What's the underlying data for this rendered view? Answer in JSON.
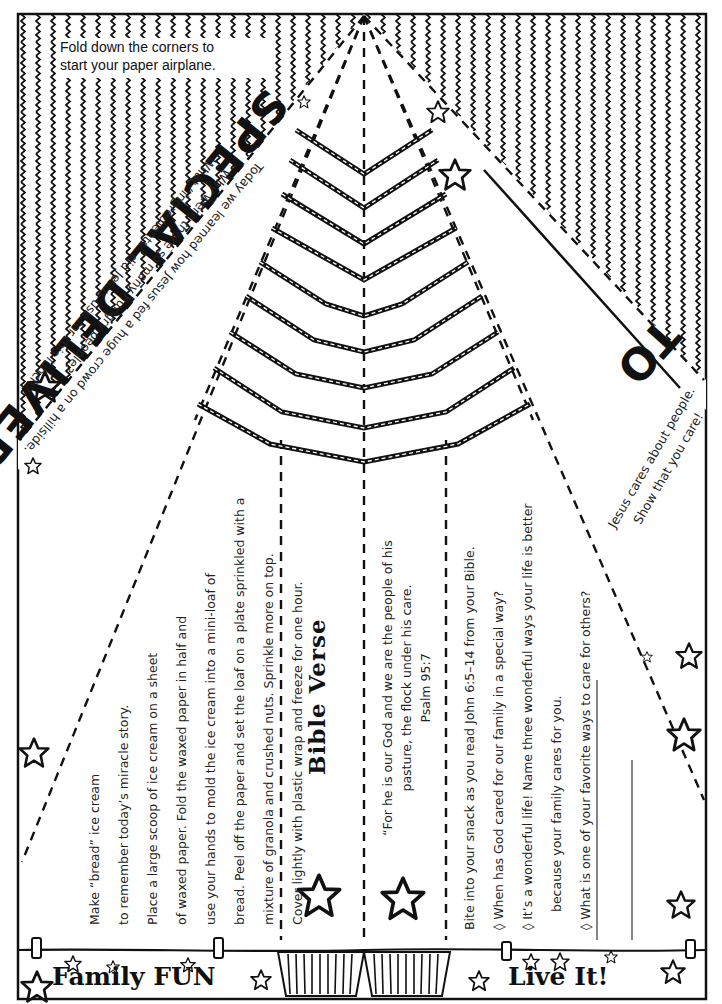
{
  "instruction_box": {
    "line1": "Fold down the corners to",
    "line2": "start your paper airplane."
  },
  "title": "SPECIAL DELIVERY",
  "to_label": "TO",
  "lesson": {
    "intro": "Today we learned how Jesus fed a huge crowd on a hillside.",
    "questions": [
      "Why were there so many hungry people?",
      "What “ingredients” did Jesus use for this lunch?"
    ]
  },
  "right_note": {
    "line1": "Jesus cares about people.",
    "line2": "Show that you care!"
  },
  "family_fun": {
    "heading": "Family FUN",
    "lines": [
      "Make “bread” ice cream",
      "to remember today’s miracle story.",
      "Place a large scoop of ice cream on a sheet",
      "of waxed paper. Fold the waxed paper in half and",
      "use your hands to mold the ice cream into a mini-loaf of",
      "bread. Peel off the paper and set the loaf on a plate sprinkled with a",
      "mixture of granola and crushed nuts. Sprinkle more on top.",
      "Cover lightly with plastic wrap and freeze for one hour."
    ]
  },
  "bible_verse": {
    "heading": "Bible Verse",
    "line1": "“For he is our God and we are the people of his",
    "line2": "pasture, the flock under his care.",
    "reference": "Psalm 95:7"
  },
  "live_it": {
    "heading": "Live It!",
    "lines": [
      "Bite into your snack as you read John 6:5–14 from your Bible.",
      "◊ When has God cared for our family in a special way?",
      "◊ It’s a wonderful life! Name three wonderful ways your life is better",
      "because your family cares for you.",
      "◊ What is one of your favorite ways to care  for others?"
    ]
  },
  "colors": {
    "ink": "#111111",
    "paper": "#ffffff",
    "text": "#222222"
  }
}
